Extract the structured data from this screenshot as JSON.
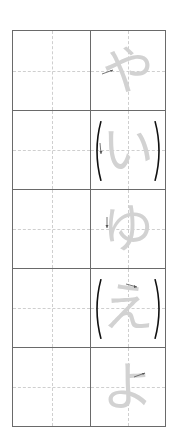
{
  "worksheet": {
    "rows": [
      {
        "kana": "や",
        "parenthesized": false,
        "stroke_hint": "right-arrow"
      },
      {
        "kana": "い",
        "parenthesized": true,
        "stroke_hint": "down-arrow"
      },
      {
        "kana": "ゆ",
        "parenthesized": false,
        "stroke_hint": "down-arrow"
      },
      {
        "kana": "え",
        "parenthesized": true,
        "stroke_hint": "right-arrow"
      },
      {
        "kana": "よ",
        "parenthesized": false,
        "stroke_hint": "right-arrow"
      }
    ],
    "colors": {
      "grid": "#6a6a6a",
      "guide": "#cfcfcf",
      "model_glyph": "#d2d2d2",
      "paren": "#111111"
    }
  }
}
